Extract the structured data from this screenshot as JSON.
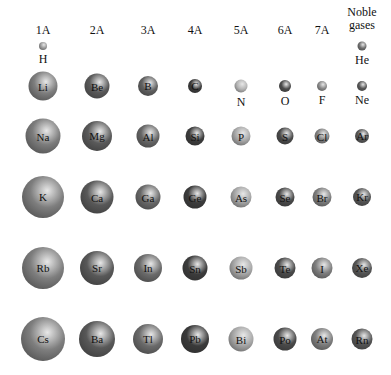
{
  "groups": [
    {
      "label": "1A",
      "x": 43
    },
    {
      "label": "2A",
      "x": 97
    },
    {
      "label": "3A",
      "x": 148
    },
    {
      "label": "4A",
      "x": 195
    },
    {
      "label": "5A",
      "x": 241
    },
    {
      "label": "6A",
      "x": 285
    },
    {
      "label": "7A",
      "x": 322
    },
    {
      "label": "Noble gases",
      "x": 362
    }
  ],
  "rows": [
    {
      "period": 1,
      "y": 46
    },
    {
      "period": 2,
      "y": 86
    },
    {
      "period": 3,
      "y": 136
    },
    {
      "period": 4,
      "y": 197
    },
    {
      "period": 5,
      "y": 268
    },
    {
      "period": 6,
      "y": 339
    }
  ],
  "elements": [
    {
      "symbol": "H",
      "col": 0,
      "row": 0,
      "d": 8,
      "shade": "#9a9a9a",
      "label_below": true
    },
    {
      "symbol": "He",
      "col": 7,
      "row": 0,
      "d": 9,
      "shade": "#6f6f6f",
      "label_below": true
    },
    {
      "symbol": "Li",
      "col": 0,
      "row": 1,
      "d": 29,
      "shade": "#7e7e7e"
    },
    {
      "symbol": "Be",
      "col": 1,
      "row": 1,
      "d": 25,
      "shade": "#5a5a5a"
    },
    {
      "symbol": "B",
      "col": 2,
      "row": 1,
      "d": 20,
      "shade": "#606060"
    },
    {
      "symbol": "C",
      "col": 3,
      "row": 1,
      "d": 14,
      "shade": "#3a3a3a"
    },
    {
      "symbol": "N",
      "col": 4,
      "row": 1,
      "d": 13,
      "shade": "#b5b5b5",
      "label_below": true
    },
    {
      "symbol": "O",
      "col": 5,
      "row": 1,
      "d": 12,
      "shade": "#4c4c4c",
      "label_below": true
    },
    {
      "symbol": "F",
      "col": 6,
      "row": 1,
      "d": 10,
      "shade": "#8a8a8a",
      "label_below": true
    },
    {
      "symbol": "Ne",
      "col": 7,
      "row": 1,
      "d": 10,
      "shade": "#585858",
      "label_below": true
    },
    {
      "symbol": "Na",
      "col": 0,
      "row": 2,
      "d": 35,
      "shade": "#7c7c7c"
    },
    {
      "symbol": "Mg",
      "col": 1,
      "row": 2,
      "d": 30,
      "shade": "#5a5a5a"
    },
    {
      "symbol": "Al",
      "col": 2,
      "row": 2,
      "d": 23,
      "shade": "#666666"
    },
    {
      "symbol": "Si",
      "col": 3,
      "row": 2,
      "d": 19,
      "shade": "#3c3c3c"
    },
    {
      "symbol": "P",
      "col": 4,
      "row": 2,
      "d": 19,
      "shade": "#a8a8a8"
    },
    {
      "symbol": "S",
      "col": 5,
      "row": 2,
      "d": 17,
      "shade": "#4a4a4a"
    },
    {
      "symbol": "Cl",
      "col": 6,
      "row": 2,
      "d": 15,
      "shade": "#828282"
    },
    {
      "symbol": "Ar",
      "col": 7,
      "row": 2,
      "d": 14,
      "shade": "#575757"
    },
    {
      "symbol": "K",
      "col": 0,
      "row": 3,
      "d": 42,
      "shade": "#7e7e7e"
    },
    {
      "symbol": "Ca",
      "col": 1,
      "row": 3,
      "d": 33,
      "shade": "#585858"
    },
    {
      "symbol": "Ga",
      "col": 2,
      "row": 3,
      "d": 25,
      "shade": "#686868"
    },
    {
      "symbol": "Ge",
      "col": 3,
      "row": 3,
      "d": 23,
      "shade": "#3c3c3c"
    },
    {
      "symbol": "As",
      "col": 4,
      "row": 3,
      "d": 21,
      "shade": "#a6a6a6"
    },
    {
      "symbol": "Se",
      "col": 5,
      "row": 3,
      "d": 19,
      "shade": "#4a4a4a"
    },
    {
      "symbol": "Br",
      "col": 6,
      "row": 3,
      "d": 19,
      "shade": "#7e7e7e"
    },
    {
      "symbol": "Kr",
      "col": 7,
      "row": 3,
      "d": 18,
      "shade": "#555555"
    },
    {
      "symbol": "Rb",
      "col": 0,
      "row": 4,
      "d": 42,
      "shade": "#7e7e7e"
    },
    {
      "symbol": "Sr",
      "col": 1,
      "row": 4,
      "d": 34,
      "shade": "#585858"
    },
    {
      "symbol": "In",
      "col": 2,
      "row": 4,
      "d": 28,
      "shade": "#6a6a6a"
    },
    {
      "symbol": "Sn",
      "col": 3,
      "row": 4,
      "d": 25,
      "shade": "#3c3c3c"
    },
    {
      "symbol": "Sb",
      "col": 4,
      "row": 4,
      "d": 23,
      "shade": "#a8a8a8"
    },
    {
      "symbol": "Te",
      "col": 5,
      "row": 4,
      "d": 21,
      "shade": "#4a4a4a"
    },
    {
      "symbol": "I",
      "col": 6,
      "row": 4,
      "d": 21,
      "shade": "#7e7e7e"
    },
    {
      "symbol": "Xe",
      "col": 7,
      "row": 4,
      "d": 20,
      "shade": "#555555"
    },
    {
      "symbol": "Cs",
      "col": 0,
      "row": 5,
      "d": 44,
      "shade": "#7e7e7e"
    },
    {
      "symbol": "Ba",
      "col": 1,
      "row": 5,
      "d": 36,
      "shade": "#585858"
    },
    {
      "symbol": "Tl",
      "col": 2,
      "row": 5,
      "d": 30,
      "shade": "#6a6a6a"
    },
    {
      "symbol": "Pb",
      "col": 3,
      "row": 5,
      "d": 28,
      "shade": "#3a3a3a"
    },
    {
      "symbol": "Bi",
      "col": 4,
      "row": 5,
      "d": 25,
      "shade": "#a8a8a8"
    },
    {
      "symbol": "Po",
      "col": 5,
      "row": 5,
      "d": 23,
      "shade": "#4a4a4a"
    },
    {
      "symbol": "At",
      "col": 6,
      "row": 5,
      "d": 22,
      "shade": "#7e7e7e"
    },
    {
      "symbol": "Rn",
      "col": 7,
      "row": 5,
      "d": 21,
      "shade": "#555555"
    }
  ]
}
